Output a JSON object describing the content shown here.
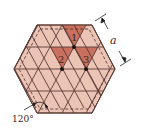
{
  "diagram": {
    "colors": {
      "hex_fill": "#ecc4b6",
      "grid_line": "#5a3a34",
      "highlight_fill": "#c9705e",
      "dashed_line": "#4a302a",
      "dot": "#1a1010",
      "background": "#ffffff"
    },
    "labels": {
      "site_1": "1",
      "site_2": "2",
      "site_3": "3",
      "lattice_constant": "a",
      "angle": "120°"
    }
  }
}
